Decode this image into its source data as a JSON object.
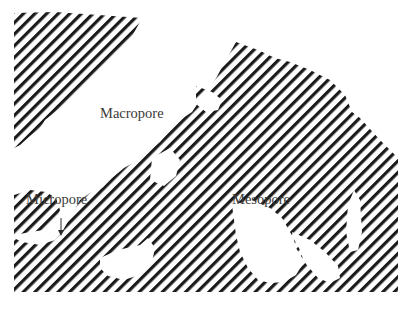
{
  "figure": {
    "type": "schematic",
    "hatch_color": "#1a1a1a",
    "background_color": "#ffffff",
    "labels": [
      {
        "id": "macropore",
        "text": "Macropore"
      },
      {
        "id": "micropore",
        "text": "Micropore"
      },
      {
        "id": "mesopore",
        "text": "Mesopore"
      }
    ]
  }
}
